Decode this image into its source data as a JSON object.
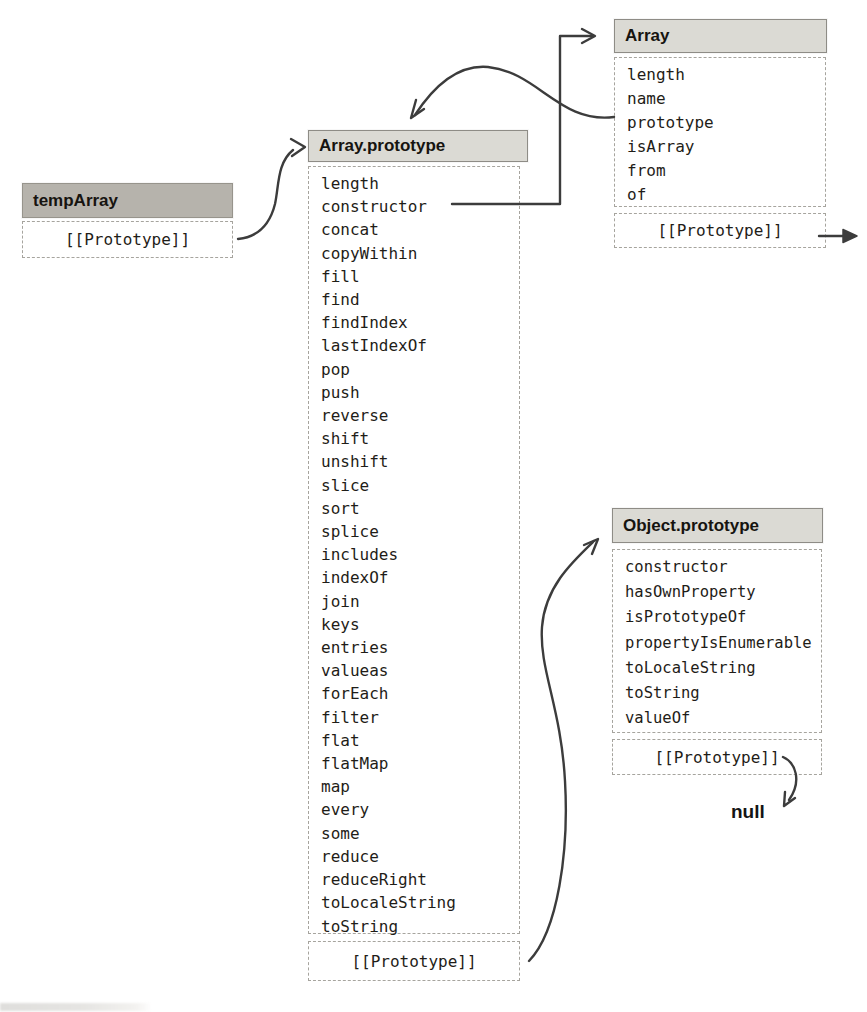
{
  "figure": {
    "nodes": {
      "temp_array": {
        "title": "tempArray",
        "proto_slot": "[[Prototype]]"
      },
      "array_prototype": {
        "title": "Array.prototype",
        "members": [
          "length",
          "constructor",
          "concat",
          "copyWithin",
          "fill",
          "find",
          "findIndex",
          "lastIndexOf",
          "pop",
          "push",
          "reverse",
          "shift",
          "unshift",
          "slice",
          "sort",
          "splice",
          "includes",
          "indexOf",
          "join",
          "keys",
          "entries",
          "valueas",
          "forEach",
          "filter",
          "flat",
          "flatMap",
          "map",
          "every",
          "some",
          "reduce",
          "reduceRight",
          "toLocaleString",
          "toString"
        ],
        "proto_slot": "[[Prototype]]"
      },
      "array": {
        "title": "Array",
        "members": [
          "length",
          "name",
          "prototype",
          "isArray",
          "from",
          "of"
        ],
        "proto_slot": "[[Prototype]]"
      },
      "object_prototype": {
        "title": "Object.prototype",
        "members": [
          "constructor",
          "hasOwnProperty",
          "isPrototypeOf",
          "propertyIsEnumerable",
          "toLocaleString",
          "toString",
          "valueOf"
        ],
        "proto_slot": "[[Prototype]]"
      },
      "null_terminal": {
        "label": "null"
      }
    },
    "edges": [
      {
        "id": "temparray-proto-to-array-prototype",
        "from": "tempArray [[Prototype]]",
        "to": "Array.prototype"
      },
      {
        "id": "array-prototype-property-to-array-prototype",
        "from": "Array prototype property",
        "to": "Array.prototype"
      },
      {
        "id": "constructor-to-array",
        "from": "Array.prototype constructor",
        "to": "Array"
      },
      {
        "id": "array-proto-offpage",
        "from": "Array [[Prototype]]",
        "to": "off-page (right)"
      },
      {
        "id": "array-prototype-proto-to-object-prototype",
        "from": "Array.prototype [[Prototype]]",
        "to": "Object.prototype"
      },
      {
        "id": "object-prototype-proto-to-null",
        "from": "Object.prototype [[Prototype]]",
        "to": "null"
      }
    ]
  },
  "colors": {
    "page_bg": "#ffffff",
    "header_fill": "#dbdad4",
    "temp_header_fill": "#b6b3ac",
    "box_border": "#8e8c86",
    "dash_color": "#a6a49e",
    "arrow_color": "#3c3c3c",
    "text_color": "#1f1d18"
  }
}
